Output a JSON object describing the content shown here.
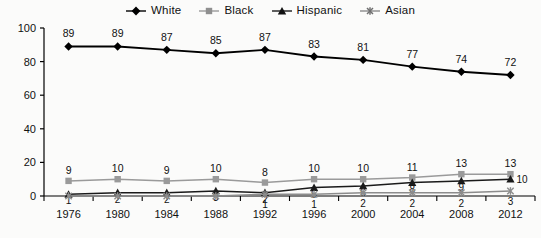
{
  "chart_data": {
    "type": "line",
    "title": "",
    "xlabel": "",
    "ylabel": "",
    "categories": [
      "1976",
      "1980",
      "1984",
      "1988",
      "1992",
      "1996",
      "2000",
      "2004",
      "2008",
      "2012"
    ],
    "ylim": [
      0,
      100
    ],
    "yticks": [
      0,
      20,
      40,
      60,
      80,
      100
    ],
    "grid": false,
    "legend_position": "top-center",
    "series": [
      {
        "name": "White",
        "marker": "diamond",
        "color": "#000000",
        "values": [
          89,
          89,
          87,
          85,
          87,
          83,
          81,
          77,
          74,
          72
        ],
        "labels": [
          "89",
          "89",
          "87",
          "85",
          "87",
          "83",
          "81",
          "77",
          "74",
          "72"
        ]
      },
      {
        "name": "Black",
        "marker": "square",
        "color": "#9a9a9a",
        "values": [
          9,
          10,
          9,
          10,
          8,
          10,
          10,
          11,
          13,
          13
        ],
        "labels": [
          "9",
          "10",
          "9",
          "10",
          "8",
          "10",
          "10",
          "11",
          "13",
          "13"
        ]
      },
      {
        "name": "Hispanic",
        "marker": "triangle",
        "color": "#1a1a1a",
        "values": [
          1,
          2,
          2,
          3,
          2,
          5,
          6,
          8,
          9,
          10
        ],
        "labels": [
          "1",
          "2",
          "2",
          "3",
          "2",
          "5",
          "6",
          "8",
          "9",
          "10"
        ]
      },
      {
        "name": "Asian",
        "marker": "asterisk",
        "color": "#8c8c8c",
        "values": [
          0,
          0,
          0,
          0,
          1,
          1,
          2,
          2,
          2,
          3
        ],
        "labels": [
          "",
          "",
          "",
          "",
          "1",
          "1",
          "2",
          "2",
          "2",
          "3"
        ]
      }
    ]
  },
  "legend": {
    "items": [
      {
        "label": "White",
        "marker": "diamond",
        "color": "#000000"
      },
      {
        "label": "Black",
        "marker": "square",
        "color": "#9a9a9a"
      },
      {
        "label": "Hispanic",
        "marker": "triangle",
        "color": "#1a1a1a"
      },
      {
        "label": "Asian",
        "marker": "asterisk",
        "color": "#8c8c8c"
      }
    ]
  },
  "axes": {
    "y_ticks": [
      "100",
      "80",
      "60",
      "40",
      "20",
      "0"
    ],
    "x_ticks": [
      "1976",
      "1980",
      "1984",
      "1988",
      "1992",
      "1996",
      "2000",
      "2004",
      "2008",
      "2012"
    ]
  }
}
